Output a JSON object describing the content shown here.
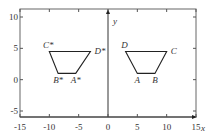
{
  "chart_data": {
    "type": "line",
    "title": "",
    "xlabel": "x",
    "ylabel": "y",
    "xlim": [
      -15,
      15
    ],
    "ylim": [
      -6,
      11
    ],
    "xticks": [
      -15,
      -10,
      -5,
      0,
      5,
      10,
      15
    ],
    "yticks": [
      -5,
      0,
      5,
      10
    ],
    "xtick_labels": [
      "-15",
      "-10",
      "-5",
      "0",
      "5",
      "10",
      "15"
    ],
    "ytick_labels": [
      "-5",
      "0",
      "5",
      "10"
    ],
    "grid": false,
    "series": [
      {
        "name": "ABCD",
        "points": [
          {
            "label": "A",
            "x": 5,
            "y": 1
          },
          {
            "label": "B",
            "x": 8,
            "y": 1
          },
          {
            "label": "C",
            "x": 10,
            "y": 4.5
          },
          {
            "label": "D",
            "x": 3,
            "y": 4.5
          }
        ]
      },
      {
        "name": "A*B*C*D*",
        "points": [
          {
            "label": "A*",
            "x": -5.5,
            "y": 1
          },
          {
            "label": "B*",
            "x": -8.5,
            "y": 1
          },
          {
            "label": "C*",
            "x": -10,
            "y": 4.5
          },
          {
            "label": "D*",
            "x": -3,
            "y": 4.5
          }
        ]
      }
    ]
  }
}
